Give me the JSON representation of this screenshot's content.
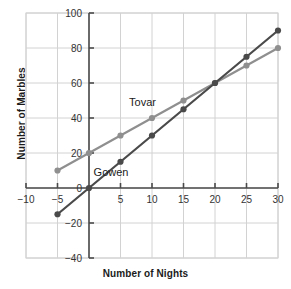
{
  "chart_data": {
    "type": "line",
    "title": "",
    "xlabel": "Number of Nights",
    "ylabel": "Number of Marbles",
    "xlim": [
      -10,
      30
    ],
    "ylim": [
      -40,
      100
    ],
    "xticks": [
      -10,
      -5,
      0,
      5,
      10,
      15,
      20,
      25,
      30
    ],
    "xtick_labels": [
      "-10",
      "-5",
      "",
      "5",
      "10",
      "15",
      "20",
      "25",
      "30"
    ],
    "yticks": [
      -40,
      -20,
      0,
      20,
      40,
      60,
      80,
      100
    ],
    "ytick_labels": [
      "-40",
      "-20",
      "0",
      "20",
      "40",
      "60",
      "80",
      "100"
    ],
    "grid": true,
    "legend_position": "inline-annotation",
    "x": [
      -5,
      0,
      5,
      10,
      15,
      20,
      25,
      30
    ],
    "series": [
      {
        "name": "Tovar",
        "color": "#8f8f8f",
        "values": [
          10,
          20,
          30,
          40,
          50,
          60,
          70,
          80
        ],
        "annotation": "Tovar"
      },
      {
        "name": "Gowen",
        "color": "#4a4a4a",
        "values": [
          -15,
          0,
          15,
          30,
          45,
          60,
          75,
          90
        ],
        "annotation": "Gowen"
      }
    ],
    "annotations": [
      {
        "text": "Tovar",
        "x": 8.5,
        "y": 47
      },
      {
        "text": "Gowen",
        "x": 3.5,
        "y": 7
      }
    ]
  },
  "colors": {
    "grid": "#d2d2d2",
    "frame": "#cfcfcf",
    "axis": "#4a4a4a",
    "tick_text": "#333333",
    "title_text": "#1b1b1b",
    "series_tovar": "#8f8f8f",
    "series_gowen": "#4a4a4a",
    "background": "#ffffff"
  }
}
